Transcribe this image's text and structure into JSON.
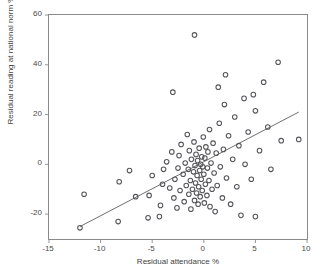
{
  "figure": {
    "top_caption": "",
    "background": "#ffffff",
    "marker_color": "#55555b",
    "line_color": "#4a4a4a",
    "axis_color": "#8a8a8a"
  },
  "chart_data": {
    "type": "scatter",
    "title": "",
    "xlabel": "Residual attendance %",
    "ylabel": "Residual reading at national norm %",
    "xlim": [
      -15,
      10
    ],
    "ylim": [
      -30,
      60
    ],
    "xticks": [
      -15,
      -10,
      -5,
      0,
      5,
      10
    ],
    "xtick_labels": [
      "-15",
      "-10",
      "-5",
      "0",
      "5",
      "10"
    ],
    "yticks": [
      -20,
      0,
      20,
      40,
      60
    ],
    "ytick_labels": [
      "-20",
      "0",
      "20",
      "40",
      "60"
    ],
    "grid": false,
    "legend": null,
    "marker_style": "open-circle",
    "fit_line": {
      "name": "linear regression",
      "x": [
        -12.0,
        9.2
      ],
      "y": [
        -25.0,
        21.0
      ]
    },
    "points": [
      [
        -12.0,
        -25.5
      ],
      [
        -11.6,
        -12.0
      ],
      [
        -8.3,
        -23.0
      ],
      [
        -8.2,
        -7.0
      ],
      [
        -7.2,
        -2.5
      ],
      [
        -6.6,
        -13.0
      ],
      [
        -5.4,
        -21.5
      ],
      [
        -5.3,
        -12.5
      ],
      [
        -5.0,
        -4.5
      ],
      [
        -4.3,
        -21.0
      ],
      [
        -4.2,
        -16.5
      ],
      [
        -4.0,
        -8.0
      ],
      [
        -3.9,
        -2.0
      ],
      [
        -3.6,
        1.0
      ],
      [
        -3.3,
        -9.5
      ],
      [
        -3.1,
        5.0
      ],
      [
        -2.9,
        -13.5
      ],
      [
        -2.8,
        -6.0
      ],
      [
        -2.6,
        -17.5
      ],
      [
        -2.5,
        -1.5
      ],
      [
        -2.4,
        3.5
      ],
      [
        -2.3,
        -10.5
      ],
      [
        -2.2,
        8.0
      ],
      [
        -2.0,
        -4.0
      ],
      [
        -1.9,
        -15.0
      ],
      [
        -1.8,
        0.5
      ],
      [
        -1.7,
        -8.5
      ],
      [
        -1.6,
        12.0
      ],
      [
        -1.5,
        -2.0
      ],
      [
        -1.45,
        -12.0
      ],
      [
        -1.4,
        5.5
      ],
      [
        -1.3,
        -6.5
      ],
      [
        -1.25,
        -18.0
      ],
      [
        -1.2,
        2.0
      ],
      [
        -1.1,
        -10.0
      ],
      [
        -1.0,
        -3.0
      ],
      [
        -0.95,
        9.0
      ],
      [
        -0.9,
        -14.5
      ],
      [
        -0.85,
        -0.5
      ],
      [
        -0.8,
        -7.5
      ],
      [
        -0.75,
        4.0
      ],
      [
        -0.7,
        -11.5
      ],
      [
        -0.65,
        -4.5
      ],
      [
        -0.6,
        1.5
      ],
      [
        -0.55,
        -16.0
      ],
      [
        -0.5,
        -9.0
      ],
      [
        -0.45,
        6.5
      ],
      [
        -0.4,
        -2.5
      ],
      [
        -0.35,
        -13.0
      ],
      [
        -0.3,
        0.0
      ],
      [
        -0.25,
        -6.0
      ],
      [
        -0.2,
        3.0
      ],
      [
        -0.15,
        -10.5
      ],
      [
        -0.1,
        -1.0
      ],
      [
        -0.05,
        11.0
      ],
      [
        0.0,
        -4.0
      ],
      [
        0.05,
        -15.5
      ],
      [
        0.1,
        2.5
      ],
      [
        0.15,
        -8.0
      ],
      [
        0.2,
        7.0
      ],
      [
        0.3,
        -12.5
      ],
      [
        0.35,
        -1.5
      ],
      [
        0.4,
        5.0
      ],
      [
        0.5,
        -6.5
      ],
      [
        0.55,
        14.0
      ],
      [
        0.6,
        -17.0
      ],
      [
        0.7,
        0.5
      ],
      [
        0.8,
        -10.0
      ],
      [
        0.9,
        8.5
      ],
      [
        1.0,
        -3.5
      ],
      [
        1.1,
        -19.0
      ],
      [
        1.2,
        4.5
      ],
      [
        1.3,
        -8.5
      ],
      [
        1.5,
        16.5
      ],
      [
        1.6,
        -1.0
      ],
      [
        1.8,
        -13.5
      ],
      [
        1.9,
        6.0
      ],
      [
        2.0,
        24.0
      ],
      [
        2.2,
        -5.5
      ],
      [
        2.4,
        11.5
      ],
      [
        2.6,
        -16.0
      ],
      [
        2.8,
        2.0
      ],
      [
        3.0,
        19.0
      ],
      [
        3.2,
        -9.0
      ],
      [
        3.4,
        7.5
      ],
      [
        3.6,
        -20.5
      ],
      [
        3.9,
        26.5
      ],
      [
        4.0,
        0.0
      ],
      [
        4.3,
        13.0
      ],
      [
        4.6,
        -6.0
      ],
      [
        5.0,
        21.5
      ],
      [
        5.0,
        -21.0
      ],
      [
        5.4,
        5.5
      ],
      [
        5.8,
        33.0
      ],
      [
        6.2,
        15.0
      ],
      [
        6.5,
        -2.0
      ],
      [
        7.2,
        41.0
      ],
      [
        7.5,
        9.5
      ],
      [
        9.2,
        10.0
      ],
      [
        -0.9,
        52.0
      ],
      [
        2.1,
        36.0
      ],
      [
        -3.0,
        29.0
      ],
      [
        4.8,
        28.0
      ],
      [
        1.4,
        31.0
      ]
    ]
  }
}
